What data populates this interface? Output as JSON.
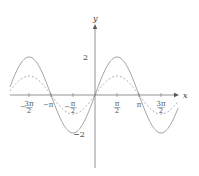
{
  "chart_data": {
    "type": "line",
    "title": "",
    "xlabel": "x",
    "ylabel": "y",
    "x_range": [
      -6.6,
      5.9
    ],
    "ylim": [
      -3.2,
      3.9
    ],
    "grid": false,
    "legend": null,
    "x_tick_labels": [
      "−3π/2",
      "−π",
      "−π/2",
      "π/2",
      "π",
      "3π/2"
    ],
    "x_tick_values": [
      -4.712,
      -3.1416,
      -1.5708,
      1.5708,
      3.1416,
      4.712
    ],
    "y_tick_labels": [
      "2",
      "−2"
    ],
    "y_tick_values": [
      2,
      -2
    ],
    "series": [
      {
        "name": "2 sin x",
        "style": "solid",
        "amplitude": 2,
        "expression": "y = 2 sin(x)",
        "x": [
          -4.712,
          -3.1416,
          -1.5708,
          0,
          1.5708,
          3.1416,
          4.712
        ],
        "values": [
          2,
          0,
          -2,
          0,
          2,
          0,
          -2
        ]
      },
      {
        "name": "sin x",
        "style": "dashed",
        "amplitude": 1,
        "expression": "y = sin(x)",
        "x": [
          -4.712,
          -3.1416,
          -1.5708,
          0,
          1.5708,
          3.1416,
          4.712
        ],
        "values": [
          1,
          0,
          -1,
          0,
          1,
          0,
          -1
        ]
      }
    ],
    "colors": {
      "axis": "#555555",
      "solid": "#999999",
      "dashed": "#aaaaaa"
    }
  },
  "axes": {
    "x_label": "x",
    "y_label": "y"
  },
  "ticks": {
    "x": [
      {
        "num": "3π",
        "den": "2",
        "neg": true
      },
      {
        "num": "π",
        "den": "",
        "neg": true
      },
      {
        "num": "π",
        "den": "2",
        "neg": true
      },
      {
        "num": "π",
        "den": "2",
        "neg": false
      },
      {
        "num": "π",
        "den": "",
        "neg": false
      },
      {
        "num": "3π",
        "den": "2",
        "neg": false
      }
    ],
    "y_pos": "2",
    "y_neg": "−2"
  }
}
